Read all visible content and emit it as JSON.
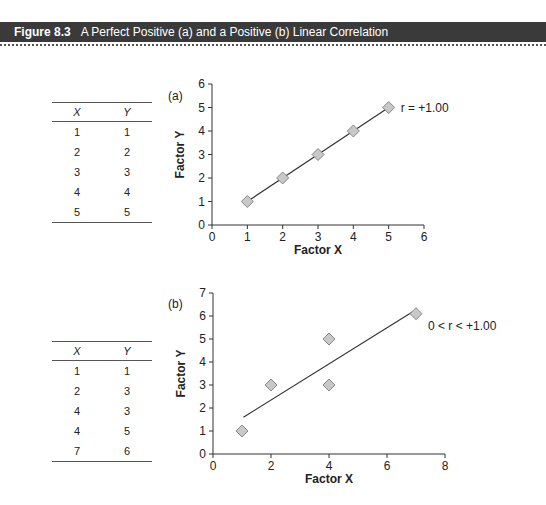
{
  "header": {
    "figure_label": "Figure 8.3",
    "title": "A Perfect Positive (a) and a Positive (b) Linear Correlation"
  },
  "tables": [
    {
      "headers": [
        "X",
        "Y"
      ],
      "rows": [
        [
          "1",
          "1"
        ],
        [
          "2",
          "2"
        ],
        [
          "3",
          "3"
        ],
        [
          "4",
          "4"
        ],
        [
          "5",
          "5"
        ]
      ]
    },
    {
      "headers": [
        "X",
        "Y"
      ],
      "rows": [
        [
          "1",
          "1"
        ],
        [
          "2",
          "3"
        ],
        [
          "4",
          "3"
        ],
        [
          "4",
          "5"
        ],
        [
          "7",
          "6"
        ]
      ]
    }
  ],
  "chart_data": [
    {
      "type": "scatter",
      "panel_label": "(a)",
      "x": [
        1,
        2,
        3,
        4,
        5
      ],
      "y": [
        1,
        2,
        3,
        4,
        5
      ],
      "fit_line": {
        "from": [
          1,
          1
        ],
        "to": [
          5,
          5
        ]
      },
      "annotation": "r = +1.00",
      "xlabel": "Factor X",
      "ylabel": "Factor Y",
      "xlim": [
        0,
        6
      ],
      "ylim": [
        0,
        6
      ],
      "xticks": [
        0,
        1,
        2,
        3,
        4,
        5,
        6
      ],
      "yticks": [
        0,
        1,
        2,
        3,
        4,
        5,
        6
      ],
      "grid": false
    },
    {
      "type": "scatter",
      "panel_label": "(b)",
      "x": [
        1,
        2,
        4,
        4,
        7
      ],
      "y": [
        1,
        3,
        3,
        5,
        6.1
      ],
      "fit_line": {
        "from": [
          1.05,
          1.6
        ],
        "to": [
          6.9,
          6.2
        ]
      },
      "annotation": "0 < r < +1.00",
      "xlabel": "Factor X",
      "ylabel": "Factor Y",
      "xlim": [
        0,
        8
      ],
      "ylim": [
        0,
        7
      ],
      "xticks": [
        0,
        2,
        4,
        6,
        8
      ],
      "yticks": [
        0,
        1,
        2,
        3,
        4,
        5,
        6,
        7
      ],
      "grid": false
    }
  ]
}
